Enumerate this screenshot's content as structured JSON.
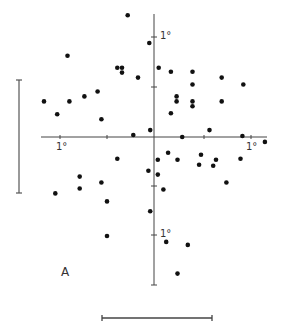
{
  "figure": {
    "panel_label": "A",
    "tick_labels": {
      "x_left": "1°",
      "x_right": "1°",
      "y_top": "1°",
      "y_bottom": "1°"
    },
    "colors": {
      "ink": "#111111",
      "axis": "#444444"
    }
  },
  "chart_data": {
    "type": "scatter",
    "title": "",
    "panel": "A",
    "xlabel": "",
    "ylabel": "",
    "units": "degrees",
    "axis_ticks": {
      "x": [
        "-1°",
        "0",
        "1°"
      ],
      "y": [
        "-1°",
        "0",
        "1°"
      ]
    },
    "xlim": [
      -1.2,
      1.2
    ],
    "ylim": [
      -1.5,
      1.3
    ],
    "grid": false,
    "legend": null,
    "scale_bars": {
      "horizontal": "1 unit",
      "vertical": "1 unit"
    },
    "points": [
      [
        -0.28,
        1.23
      ],
      [
        -0.05,
        0.95
      ],
      [
        -0.92,
        0.82
      ],
      [
        -0.39,
        0.7
      ],
      [
        -0.34,
        0.7
      ],
      [
        -0.34,
        0.65
      ],
      [
        0.05,
        0.7
      ],
      [
        0.18,
        0.66
      ],
      [
        0.41,
        0.66
      ],
      [
        -0.17,
        0.6
      ],
      [
        0.72,
        0.6
      ],
      [
        0.41,
        0.53
      ],
      [
        0.95,
        0.53
      ],
      [
        -0.6,
        0.46
      ],
      [
        -0.74,
        0.41
      ],
      [
        -1.17,
        0.36
      ],
      [
        -0.9,
        0.36
      ],
      [
        -1.03,
        0.23
      ],
      [
        -0.56,
        0.18
      ],
      [
        0.24,
        0.41
      ],
      [
        0.24,
        0.36
      ],
      [
        0.41,
        0.36
      ],
      [
        0.41,
        0.31
      ],
      [
        0.72,
        0.36
      ],
      [
        0.18,
        0.24
      ],
      [
        -0.22,
        0.02
      ],
      [
        -0.04,
        0.07
      ],
      [
        0.3,
        0.0
      ],
      [
        0.59,
        0.07
      ],
      [
        0.94,
        0.01
      ],
      [
        1.18,
        -0.05
      ],
      [
        -0.39,
        -0.22
      ],
      [
        0.25,
        -0.23
      ],
      [
        -0.06,
        -0.34
      ],
      [
        0.04,
        -0.38
      ],
      [
        0.1,
        -0.53
      ],
      [
        -1.05,
        -0.57
      ],
      [
        -0.79,
        -0.4
      ],
      [
        -0.79,
        -0.52
      ],
      [
        -0.56,
        -0.46
      ],
      [
        -0.5,
        -0.65
      ],
      [
        -0.5,
        -1.0
      ],
      [
        -0.04,
        -0.75
      ],
      [
        0.13,
        -1.06
      ],
      [
        0.36,
        -1.09
      ],
      [
        0.25,
        -1.38
      ],
      [
        0.66,
        -0.23
      ],
      [
        0.63,
        -0.29
      ],
      [
        0.77,
        -0.46
      ],
      [
        0.92,
        -0.22
      ],
      [
        0.48,
        -0.28
      ],
      [
        0.04,
        -0.23
      ],
      [
        0.15,
        -0.16
      ],
      [
        0.5,
        -0.18
      ]
    ]
  }
}
